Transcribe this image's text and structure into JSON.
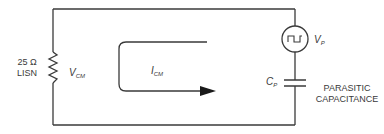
{
  "diagram": {
    "type": "circuit-schematic",
    "colors": {
      "wire": "#3a3a3a",
      "text": "#3a3a3a",
      "background": "#ffffff"
    },
    "components": {
      "lisn": {
        "value": "25 Ω",
        "name": "LISN",
        "voltage_label_main": "V",
        "voltage_label_sub": "CM"
      },
      "current": {
        "label_main": "I",
        "label_sub": "CM"
      },
      "source": {
        "label_main": "V",
        "label_sub": "P",
        "icon": "square-wave-icon"
      },
      "capacitor": {
        "label_main": "C",
        "label_sub": "P",
        "description_line1": "PARASITIC",
        "description_line2": "CAPACITANCE"
      }
    }
  }
}
